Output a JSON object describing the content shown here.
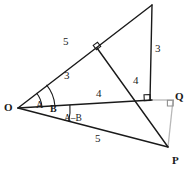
{
  "figure": {
    "background_color": "#ffffff",
    "stroke_color": "#1a1a1a",
    "faint_stroke_color": "#b8b8b8",
    "width": 194,
    "height": 172
  },
  "points": {
    "o": {
      "label": "O",
      "x": 18,
      "y": 108
    },
    "p": {
      "label": "P",
      "x": 167,
      "y": 146
    },
    "q": {
      "label": "Q",
      "x": 172,
      "y": 104
    },
    "apex": {
      "label": "",
      "x": 152,
      "y": 5
    },
    "foot": {
      "label": "",
      "x": 148,
      "y": 100
    },
    "mid": {
      "label": "",
      "x": 97,
      "y": 48
    }
  },
  "point_labels": [
    {
      "name": "vertex-label-o",
      "text": "O",
      "x": 4,
      "y": 102
    },
    {
      "name": "vertex-label-q",
      "text": "Q",
      "x": 175,
      "y": 91
    },
    {
      "name": "vertex-label-p",
      "text": "P",
      "x": 172,
      "y": 155
    }
  ],
  "length_labels": [
    {
      "name": "length-label-5-upper",
      "text": "5",
      "x": 63,
      "y": 36
    },
    {
      "name": "length-label-3-upper",
      "text": "3",
      "x": 64,
      "y": 70
    },
    {
      "name": "length-label-3-right",
      "text": "3",
      "x": 155,
      "y": 43
    },
    {
      "name": "length-label-4-diagonal",
      "text": "4",
      "x": 133,
      "y": 75
    },
    {
      "name": "length-label-4-horizontal",
      "text": "4",
      "x": 96,
      "y": 88
    },
    {
      "name": "length-label-5-lower",
      "text": "5",
      "x": 95,
      "y": 133
    }
  ],
  "angle_labels": [
    {
      "name": "angle-label-a",
      "text": "A",
      "x": 36,
      "y": 100
    },
    {
      "name": "angle-label-b",
      "text": "B",
      "x": 50,
      "y": 104
    },
    {
      "name": "angle-label-a-minus-b",
      "text": "A–B",
      "x": 64,
      "y": 114
    }
  ],
  "segments": [
    {
      "name": "ray-o-to-apex",
      "from": "o",
      "to": "apex",
      "style": "solid"
    },
    {
      "name": "segment-apex-to-foot-vertical",
      "from": "apex",
      "to": "foot_vertical",
      "style": "solid"
    },
    {
      "name": "segment-mid-to-p",
      "from": "mid",
      "to": "p",
      "style": "solid"
    },
    {
      "name": "segment-o-to-q-horizontal",
      "from": "o",
      "to": "foot",
      "style": "solid"
    },
    {
      "name": "segment-foot-to-q-faint",
      "from": "foot",
      "to": "q",
      "style": "faint"
    },
    {
      "name": "segment-q-to-p-faint",
      "from": "q",
      "to": "p",
      "style": "faint"
    },
    {
      "name": "segment-o-to-p",
      "from": "o",
      "to": "p",
      "style": "solid"
    }
  ],
  "right_angle_marks": [
    {
      "name": "right-angle-mark-mid",
      "x": 97,
      "y": 48
    },
    {
      "name": "right-angle-mark-foot",
      "x": 148,
      "y": 100
    },
    {
      "name": "right-angle-mark-q",
      "x": 172,
      "y": 104
    }
  ],
  "angle_arcs": [
    {
      "name": "angle-arc-a",
      "vertex": "o",
      "radius": 24
    },
    {
      "name": "angle-arc-b",
      "vertex": "o",
      "radius": 37
    },
    {
      "name": "angle-arc-a-minus-b",
      "vertex": "o",
      "radius": 52
    }
  ]
}
